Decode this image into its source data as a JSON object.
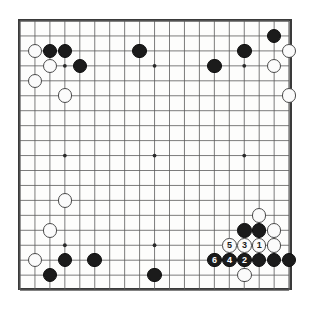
{
  "figure": {
    "name": "go-board-diagram",
    "type": "go-game-diagram",
    "board_size": 19,
    "background_color": "#ffffff",
    "border_color": "#3a3a3a",
    "line_color": "#5a5a5a",
    "black_color": "#1b1b1b",
    "white_color": "#fbfbfb"
  },
  "geometry": {
    "origin_x": 20.0,
    "origin_y": 21.0,
    "spacing": 14.95,
    "stone_diameter": 14.6,
    "star_points": [
      [
        3,
        3
      ],
      [
        9,
        3
      ],
      [
        15,
        3
      ],
      [
        3,
        9
      ],
      [
        9,
        9
      ],
      [
        15,
        9
      ],
      [
        3,
        15
      ],
      [
        9,
        15
      ],
      [
        15,
        15
      ]
    ]
  },
  "stones": [
    {
      "col": 1,
      "row": 2,
      "color": "white",
      "label": ""
    },
    {
      "col": 2,
      "row": 2,
      "color": "black",
      "label": ""
    },
    {
      "col": 3,
      "row": 2,
      "color": "black",
      "label": ""
    },
    {
      "col": 2,
      "row": 3,
      "color": "white",
      "label": ""
    },
    {
      "col": 4,
      "row": 3,
      "color": "black",
      "label": ""
    },
    {
      "col": 1,
      "row": 4,
      "color": "white",
      "label": ""
    },
    {
      "col": 3,
      "row": 5,
      "color": "white",
      "label": ""
    },
    {
      "col": 8,
      "row": 2,
      "color": "black",
      "label": ""
    },
    {
      "col": 13,
      "row": 3,
      "color": "black",
      "label": ""
    },
    {
      "col": 15,
      "row": 2,
      "color": "black",
      "label": ""
    },
    {
      "col": 17,
      "row": 1,
      "color": "black",
      "label": ""
    },
    {
      "col": 18,
      "row": 2,
      "color": "white",
      "label": ""
    },
    {
      "col": 17,
      "row": 3,
      "color": "white",
      "label": ""
    },
    {
      "col": 18,
      "row": 5,
      "color": "white",
      "label": ""
    },
    {
      "col": 3,
      "row": 12,
      "color": "white",
      "label": ""
    },
    {
      "col": 2,
      "row": 14,
      "color": "white",
      "label": ""
    },
    {
      "col": 1,
      "row": 16,
      "color": "white",
      "label": ""
    },
    {
      "col": 3,
      "row": 16,
      "color": "black",
      "label": ""
    },
    {
      "col": 2,
      "row": 17,
      "color": "black",
      "label": ""
    },
    {
      "col": 5,
      "row": 16,
      "color": "black",
      "label": ""
    },
    {
      "col": 9,
      "row": 17,
      "color": "black",
      "label": ""
    },
    {
      "col": 16,
      "row": 13,
      "color": "white",
      "label": ""
    },
    {
      "col": 15,
      "row": 14,
      "color": "black",
      "label": ""
    },
    {
      "col": 16,
      "row": 14,
      "color": "black",
      "label": ""
    },
    {
      "col": 17,
      "row": 14,
      "color": "white",
      "label": ""
    },
    {
      "col": 17,
      "row": 15,
      "color": "white",
      "label": ""
    },
    {
      "col": 17,
      "row": 16,
      "color": "black",
      "label": ""
    },
    {
      "col": 18,
      "row": 16,
      "color": "black",
      "label": ""
    },
    {
      "col": 16,
      "row": 16,
      "color": "black",
      "label": ""
    },
    {
      "col": 15,
      "row": 17,
      "color": "white",
      "label": ""
    },
    {
      "col": 16,
      "row": 15,
      "color": "white",
      "label": "1"
    },
    {
      "col": 15,
      "row": 16,
      "color": "black",
      "label": "2"
    },
    {
      "col": 15,
      "row": 15,
      "color": "white",
      "label": "3"
    },
    {
      "col": 14,
      "row": 16,
      "color": "black",
      "label": "4"
    },
    {
      "col": 14,
      "row": 15,
      "color": "white",
      "label": "5"
    },
    {
      "col": 13,
      "row": 16,
      "color": "black",
      "label": "6"
    }
  ],
  "move_sequence": [
    {
      "number": "1",
      "color": "white"
    },
    {
      "number": "2",
      "color": "black"
    },
    {
      "number": "3",
      "color": "white"
    },
    {
      "number": "4",
      "color": "black"
    },
    {
      "number": "5",
      "color": "white"
    },
    {
      "number": "6",
      "color": "black"
    }
  ]
}
